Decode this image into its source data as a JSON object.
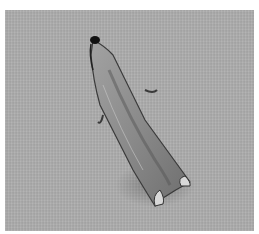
{
  "image": {
    "subject": "moth",
    "description": "Elongated grey-brown moth resting diagonally on a grey textured fabric background",
    "colors": {
      "background": "#a9a9a9",
      "wing_light": "#9a9a9a",
      "wing_dark": "#4a4a4a",
      "head": "#111111"
    }
  }
}
